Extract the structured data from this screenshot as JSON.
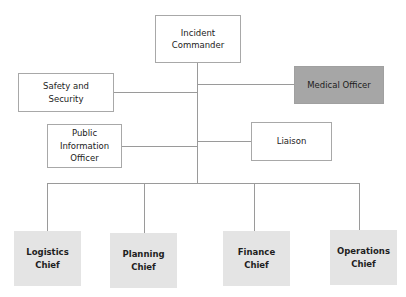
{
  "diagram": {
    "type": "org-chart",
    "colors": {
      "line": "#9a9a9a",
      "box_border": "#a8a8a8",
      "medical_fill": "#a6a6a6",
      "chief_fill": "#e4e4e4"
    },
    "root": {
      "label": "Incident\nCommander"
    },
    "staff": [
      {
        "id": "safety",
        "label": "Safety and\nSecurity",
        "side": "left"
      },
      {
        "id": "medical",
        "label": "Medical Officer",
        "side": "right",
        "highlighted": true
      },
      {
        "id": "pio",
        "label": "Public\nInformation\nOfficer",
        "side": "left"
      },
      {
        "id": "liaison",
        "label": "Liaison",
        "side": "right"
      }
    ],
    "chiefs": [
      {
        "id": "logistics",
        "label": "Logistics\nChief"
      },
      {
        "id": "planning",
        "label": "Planning\nChief"
      },
      {
        "id": "finance",
        "label": "Finance\nChief"
      },
      {
        "id": "operations",
        "label": "Operations\nChief"
      }
    ]
  }
}
